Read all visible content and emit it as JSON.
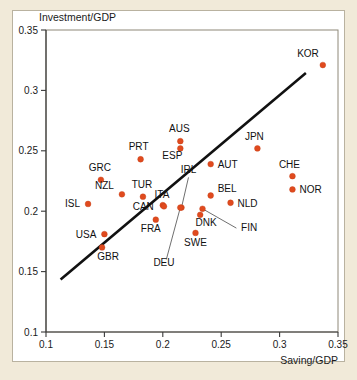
{
  "figure": {
    "background_color": "#f1ead9",
    "card_color": "#ffffff",
    "marker_color": "#e04a1e",
    "line_color": "#111111"
  },
  "chart_data": {
    "type": "scatter",
    "title": "",
    "subtitle": "",
    "xlabel": "Saving/GDP",
    "ylabel": "Investment/GDP",
    "xlim": [
      0.1,
      0.35
    ],
    "ylim": [
      0.1,
      0.35
    ],
    "xticks": [
      "0.1",
      "0.15",
      "0.2",
      "0.25",
      "0.3",
      "0.35"
    ],
    "yticks": [
      "0.1",
      "0.15",
      "0.2",
      "0.25",
      "0.3",
      "0.35"
    ],
    "xtick_values": [
      0.1,
      0.15,
      0.2,
      0.25,
      0.3,
      0.35
    ],
    "ytick_values": [
      0.1,
      0.15,
      0.2,
      0.25,
      0.3,
      0.35
    ],
    "grid": false,
    "legend": "none",
    "points": [
      {
        "label": "KOR",
        "x": 0.337,
        "y": 0.321,
        "label_dx": -4,
        "label_dy": -8,
        "anchor": "end"
      },
      {
        "label": "JPN",
        "x": 0.281,
        "y": 0.252,
        "label_dx": -3,
        "label_dy": -8,
        "anchor": "middle"
      },
      {
        "label": "CHE",
        "x": 0.311,
        "y": 0.229,
        "label_dx": -3,
        "label_dy": -8,
        "anchor": "middle"
      },
      {
        "label": "NOR",
        "x": 0.311,
        "y": 0.218,
        "label_dx": 7,
        "label_dy": 4,
        "anchor": "start"
      },
      {
        "label": "AUS",
        "x": 0.215,
        "y": 0.258,
        "label_dx": -1,
        "label_dy": -9,
        "anchor": "middle"
      },
      {
        "label": "ESP",
        "x": 0.215,
        "y": 0.252,
        "label_dx": -8,
        "label_dy": 11,
        "anchor": "middle"
      },
      {
        "label": "AUT",
        "x": 0.241,
        "y": 0.239,
        "label_dx": 7,
        "label_dy": 4,
        "anchor": "start"
      },
      {
        "label": "PRT",
        "x": 0.181,
        "y": 0.243,
        "label_dx": -2,
        "label_dy": -9,
        "anchor": "middle"
      },
      {
        "label": "GRC",
        "x": 0.147,
        "y": 0.226,
        "label_dx": -1,
        "label_dy": -9,
        "anchor": "middle"
      },
      {
        "label": "NZL",
        "x": 0.165,
        "y": 0.214,
        "label_dx": -8,
        "label_dy": -5,
        "anchor": "end"
      },
      {
        "label": "TUR",
        "x": 0.183,
        "y": 0.212,
        "label_dx": -1,
        "label_dy": -9,
        "anchor": "middle"
      },
      {
        "label": "BEL",
        "x": 0.241,
        "y": 0.213,
        "label_dx": 7,
        "label_dy": -3,
        "anchor": "start"
      },
      {
        "label": "NLD",
        "x": 0.258,
        "y": 0.207,
        "label_dx": 7,
        "label_dy": 4,
        "anchor": "start"
      },
      {
        "label": "ISL",
        "x": 0.136,
        "y": 0.206,
        "label_dx": -8,
        "label_dy": 3,
        "anchor": "end"
      },
      {
        "label": "CAN",
        "x": 0.2,
        "y": 0.205,
        "label_dx": -9,
        "label_dy": 5,
        "anchor": "end"
      },
      {
        "label": "ITA",
        "x": 0.201,
        "y": 0.204,
        "label_dx": -2,
        "label_dy": -8,
        "anchor": "middle"
      },
      {
        "label": "IRL",
        "x": 0.216,
        "y": 0.203,
        "label_dx": 0,
        "label_dy": 0,
        "anchor": "middle",
        "leader": {
          "x": 0.222,
          "y": 0.228
        }
      },
      {
        "label": "FIN",
        "x": 0.234,
        "y": 0.202,
        "label_dx": 0,
        "label_dy": 0,
        "anchor": "start",
        "leader": {
          "x": 0.263,
          "y": 0.186
        }
      },
      {
        "label": "DNK",
        "x": 0.232,
        "y": 0.197,
        "label_dx": 6,
        "label_dy": 11,
        "anchor": "middle"
      },
      {
        "label": "FRA",
        "x": 0.194,
        "y": 0.193,
        "label_dx": -5,
        "label_dy": 12,
        "anchor": "middle"
      },
      {
        "label": "SWE",
        "x": 0.228,
        "y": 0.182,
        "label_dx": 0,
        "label_dy": 13,
        "anchor": "middle"
      },
      {
        "label": "USA",
        "x": 0.15,
        "y": 0.181,
        "label_dx": -8,
        "label_dy": 4,
        "anchor": "end"
      },
      {
        "label": "DEU",
        "x": 0.215,
        "y": 0.203,
        "label_dx": 0,
        "label_dy": 0,
        "anchor": "middle",
        "leader": {
          "x": 0.203,
          "y": 0.16
        }
      },
      {
        "label": "GBR",
        "x": 0.148,
        "y": 0.17,
        "label_dx": 6,
        "label_dy": 13,
        "anchor": "middle"
      }
    ],
    "fit_line": {
      "x1": 0.1125,
      "y1": 0.1435,
      "x2": 0.3225,
      "y2": 0.3145
    },
    "standalone_labels": [
      {
        "label": "IRL",
        "x": 0.222,
        "y": 0.232,
        "anchor": "middle"
      },
      {
        "label": "DEU",
        "x": 0.201,
        "y": 0.1545,
        "anchor": "middle"
      },
      {
        "label": "FIN",
        "x": 0.267,
        "y": 0.1835,
        "anchor": "start"
      }
    ]
  },
  "accessibility": {
    "chart_description": "Scatter plot of Investment/GDP versus Saving/GDP for OECD countries with a fitted straight line."
  }
}
